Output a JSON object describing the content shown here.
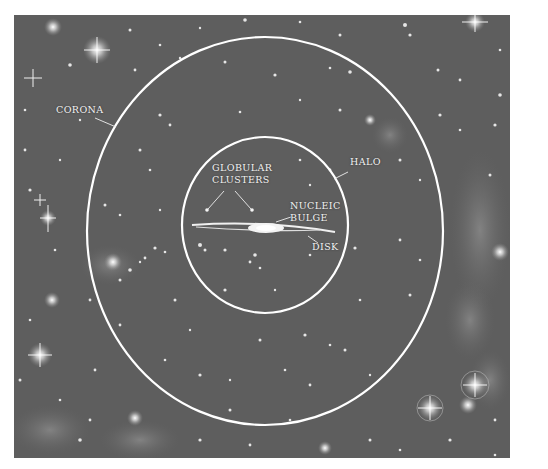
{
  "diagram": {
    "background_color": "#5e5e5e",
    "ring_color": "#ffffff",
    "regions": [
      {
        "id": "corona",
        "label": "CORONA",
        "shape": "outer-ellipse"
      },
      {
        "id": "halo",
        "label": "HALO",
        "shape": "inner-ellipse"
      },
      {
        "id": "globular-clusters",
        "label": "GLOBULAR\nCLUSTERS",
        "shape": "points"
      },
      {
        "id": "nucleic-bulge",
        "label": "NUCLEIC\nBULGE",
        "shape": "central-bulge"
      },
      {
        "id": "disk",
        "label": "DISK",
        "shape": "thin-disk"
      }
    ]
  },
  "labels": {
    "corona": "CORONA",
    "halo": "HALO",
    "globular_line1": "GLOBULAR",
    "globular_line2": "CLUSTERS",
    "bulge_line1": "NUCLEIC",
    "bulge_line2": "BULGE",
    "disk": "DISK"
  }
}
